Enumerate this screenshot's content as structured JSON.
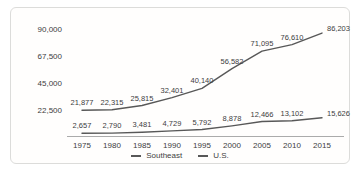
{
  "chart_data": {
    "type": "line",
    "title": "",
    "x": [
      1975,
      1980,
      1985,
      1990,
      1995,
      2000,
      2005,
      2010,
      2015
    ],
    "x_labels": [
      "1975",
      "1980",
      "1985",
      "1990",
      "1995",
      "2000",
      "2005",
      "2010",
      "2015"
    ],
    "series": [
      {
        "name": "Southeast",
        "values": [
          2657,
          2790,
          3481,
          4729,
          5792,
          8878,
          12466,
          13102,
          15626
        ],
        "labels": [
          "2,657",
          "2,790",
          "3,481",
          "4,729",
          "5,792",
          "8,878",
          "12,466",
          "13,102",
          "15,626"
        ],
        "color": "#585858"
      },
      {
        "name": "U.S.",
        "values": [
          21877,
          22315,
          25815,
          32401,
          40140,
          56582,
          71095,
          76610,
          86203
        ],
        "labels": [
          "21,877",
          "22,315",
          "25,815",
          "32,401",
          "40,140",
          "56,582",
          "71,095",
          "76,610",
          "86,203"
        ],
        "color": "#585858"
      }
    ],
    "y_ticks": [
      {
        "value": 22500,
        "label": "22,500"
      },
      {
        "value": 45000,
        "label": "45,000"
      },
      {
        "value": 67500,
        "label": "67,500"
      },
      {
        "value": 90000,
        "label": "90,000"
      }
    ],
    "ylim": [
      0,
      97000
    ],
    "grid": false,
    "legend_position": "bottom",
    "colors": {
      "line": "#585858",
      "axis": "#ababab",
      "text": "#3d3d3d",
      "card_border": "#dcdcda"
    }
  }
}
